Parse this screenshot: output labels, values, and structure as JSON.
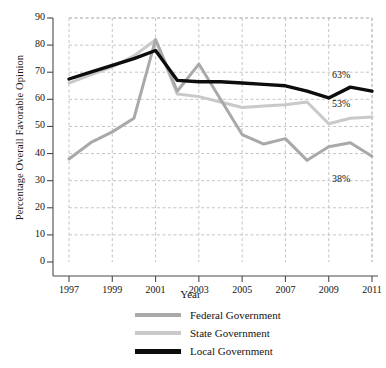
{
  "chart_data": {
    "type": "line",
    "title": "",
    "xlabel": "Year",
    "ylabel": "Percentage Overall Favorable Opinion",
    "x": [
      1997,
      1998,
      1999,
      2000,
      2001,
      2002,
      2003,
      2004,
      2005,
      2006,
      2007,
      2008,
      2009,
      2010,
      2011
    ],
    "xticks": [
      "1997",
      "1999",
      "2001",
      "2003",
      "2005",
      "2007",
      "2009",
      "2011"
    ],
    "xtick_values": [
      1997,
      1999,
      2001,
      2003,
      2005,
      2007,
      2009,
      2011
    ],
    "yticks": [
      "0",
      "10",
      "20",
      "30",
      "40",
      "50",
      "60",
      "70",
      "80",
      "90"
    ],
    "ytick_values": [
      0,
      10,
      20,
      30,
      40,
      50,
      60,
      70,
      80,
      90
    ],
    "xlim": [
      1997,
      2011
    ],
    "ylim": [
      0,
      90
    ],
    "grid": true,
    "grid_style": "dashed",
    "legend_position": "bottom",
    "series": [
      {
        "name": "Federal Government",
        "color": "#a9a9a9",
        "values": [
          38,
          44,
          48,
          53,
          82,
          63,
          73,
          60,
          47,
          43.5,
          45.5,
          37.5,
          42.5,
          44,
          39
        ],
        "end_label": "38%"
      },
      {
        "name": "State Government",
        "color": "#c9c9c9",
        "values": [
          66,
          69,
          72,
          76,
          82,
          62,
          61,
          59,
          57,
          57.5,
          58,
          59,
          51,
          53,
          53.5
        ],
        "end_label": "53%"
      },
      {
        "name": "Local Government",
        "color": "#0d0d0d",
        "values": [
          67.5,
          70,
          72.5,
          75,
          78,
          67,
          66.5,
          66.5,
          66,
          65.5,
          65,
          63,
          60.5,
          64.5,
          63
        ],
        "end_label": "63%"
      }
    ],
    "annotations": [
      {
        "text": "63%",
        "series": "Local Government",
        "x": 2011,
        "y": 63
      },
      {
        "text": "53%",
        "series": "State Government",
        "x": 2011,
        "y": 53
      },
      {
        "text": "38%",
        "series": "Federal Government",
        "x": 2011,
        "y": 38
      }
    ]
  },
  "legend": {
    "items": [
      {
        "label": "Federal Government",
        "color": "#a9a9a9"
      },
      {
        "label": "State Government",
        "color": "#c9c9c9"
      },
      {
        "label": "Local Government",
        "color": "#0d0d0d"
      }
    ]
  },
  "axes": {
    "y_title": "Percentage Overall Favorable Opinion",
    "x_title": "Year"
  }
}
